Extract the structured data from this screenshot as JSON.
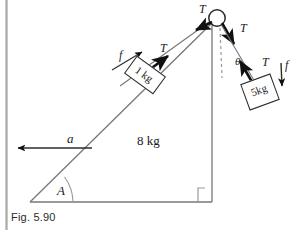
{
  "figure": {
    "caption": "Fig. 5.90"
  },
  "labels": {
    "tension_top_left": "T",
    "tension_top_right": "T",
    "tension_incline": "T",
    "tension_hanging": "T",
    "friction_incline": "f",
    "friction_hanging": "f",
    "angle_theta": "θ",
    "acceleration": "a",
    "angle_A": "A"
  },
  "masses": {
    "wedge": "8 kg",
    "block_on_incline": "1 kg",
    "hanging_block": "5kg"
  },
  "icons": {
    "pulley": "pulley-circle-icon",
    "right_angle": "right-angle-marker-icon",
    "angle_arc": "angle-arc-icon",
    "dashed_vertical": "dashed-vertical-reference-line"
  },
  "colors": {
    "ink": "#1a1a1a",
    "line": "#6b6b6b",
    "arrow": "#111111",
    "page_edge": "#a9a9a9",
    "background": "#ffffff"
  },
  "geometry": {
    "incline_angle_deg": 36,
    "theta_deg": 20,
    "triangle_vertices": "(30,202) (212,202) (212,22)"
  }
}
